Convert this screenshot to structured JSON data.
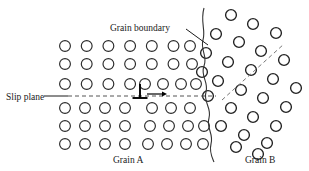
{
  "figure": {
    "background_color": "#ffffff",
    "width": 309,
    "height": 171
  },
  "labels": {
    "grain_boundary": "Grain boundary",
    "slip_plane": "Slip plane",
    "grain_a": "Grain A",
    "grain_b": "Grain B"
  },
  "colors": {
    "atom_stroke": "#2b2b2b",
    "atom_fill": "#ffffff",
    "line": "#1a1a1a",
    "dashed": "#555555",
    "text": "#1a1a1a"
  },
  "diagram_data": {
    "type": "schematic",
    "atom_radius": 5.4,
    "grain_a": {
      "lattice": "square",
      "rotation_deg": 0,
      "col_spacing": 21.7,
      "row_spacing": 18.0,
      "origin": [
        65,
        46
      ],
      "rows": [
        {
          "index": 0,
          "y": 46,
          "xs": [
            65,
            86.7,
            108.4,
            130.1,
            151.8,
            173.5,
            190.0
          ]
        },
        {
          "index": 1,
          "y": 64,
          "xs": [
            65,
            86.7,
            108.4,
            130.1,
            151.8,
            173.5,
            192.0
          ]
        },
        {
          "index": 2,
          "y": 84,
          "xs": [
            65,
            86.7,
            108.4,
            130.1,
            145.0,
            163.0,
            181.0,
            196.0
          ]
        },
        {
          "index": 3,
          "y": 108,
          "xs": [
            65,
            85.0,
            105.0,
            125.0,
            152.0,
            171.0,
            190.0
          ]
        },
        {
          "index": 4,
          "y": 126,
          "xs": [
            65,
            85.0,
            105.0,
            125.0,
            150.0,
            169.0,
            188.0,
            204.0
          ]
        },
        {
          "index": 5,
          "y": 144,
          "xs": [
            65,
            85.0,
            105.0,
            125.0,
            148.0,
            167.0,
            186.0,
            203.0
          ]
        }
      ]
    },
    "grain_b": {
      "lattice": "square",
      "rotation_deg": -24,
      "spacing": 19.5,
      "origin": [
        248,
        74
      ],
      "atoms": [
        [
          231,
          15
        ],
        [
          253,
          24
        ],
        [
          276,
          33
        ],
        [
          216,
          34
        ],
        [
          239,
          42
        ],
        [
          261,
          51
        ],
        [
          284,
          60
        ],
        [
          206,
          53
        ],
        [
          228,
          62
        ],
        [
          251,
          70
        ],
        [
          273,
          79
        ],
        [
          296,
          88
        ],
        [
          202,
          72
        ],
        [
          218,
          81
        ],
        [
          241,
          90
        ],
        [
          263,
          98
        ],
        [
          286,
          107
        ],
        [
          208,
          96
        ],
        [
          231,
          108
        ],
        [
          253,
          117
        ],
        [
          276,
          126
        ],
        [
          221,
          126
        ],
        [
          244,
          135
        ],
        [
          267,
          143
        ],
        [
          236,
          147
        ],
        [
          258,
          154
        ]
      ],
      "slip_trace": {
        "x1": 222,
        "y1": 100,
        "x2": 284,
        "y2": 44
      }
    },
    "slip_plane_line": {
      "x1": 68,
      "y1": 96,
      "x2": 216,
      "y2": 96,
      "style": "dashed"
    },
    "slip_plane_leader": {
      "x1": 44,
      "y1": 96,
      "x2": 68,
      "y2": 96,
      "style": "solid"
    },
    "grain_boundary_leader": {
      "x1": 186,
      "y1": 29,
      "x2": 208,
      "y2": 45,
      "style": "solid"
    },
    "grain_boundary_curve": "wavy vertical line from (205,10) to (215,160)",
    "dislocation_symbol": {
      "type": "inverted-T",
      "x": 140,
      "y_top": 84,
      "y_base": 98,
      "half_width": 7.5
    },
    "motion_arrow": {
      "x1": 147,
      "y1": 94,
      "x2": 167,
      "y2": 94,
      "direction": "right"
    }
  },
  "text_positions": {
    "grain_boundary": {
      "x": 110,
      "y": 31
    },
    "slip_plane": {
      "x": 6,
      "y": 100
    },
    "grain_a": {
      "x": 113,
      "y": 163
    },
    "grain_b": {
      "x": 245,
      "y": 163
    }
  }
}
